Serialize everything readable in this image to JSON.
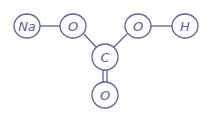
{
  "diagram": {
    "molecule": "sodium bicarbonate",
    "color": "#5a5f9e",
    "atoms": [
      {
        "id": "na",
        "label": "Na"
      },
      {
        "id": "o1",
        "label": "O"
      },
      {
        "id": "c",
        "label": "C"
      },
      {
        "id": "o2",
        "label": "O"
      },
      {
        "id": "h",
        "label": "H"
      },
      {
        "id": "o3",
        "label": "O"
      }
    ],
    "bonds": [
      {
        "from": "na",
        "to": "o1",
        "order": 1
      },
      {
        "from": "o1",
        "to": "c",
        "order": 1
      },
      {
        "from": "c",
        "to": "o2",
        "order": 1
      },
      {
        "from": "o2",
        "to": "h",
        "order": 1
      },
      {
        "from": "c",
        "to": "o3",
        "order": 2
      }
    ]
  }
}
